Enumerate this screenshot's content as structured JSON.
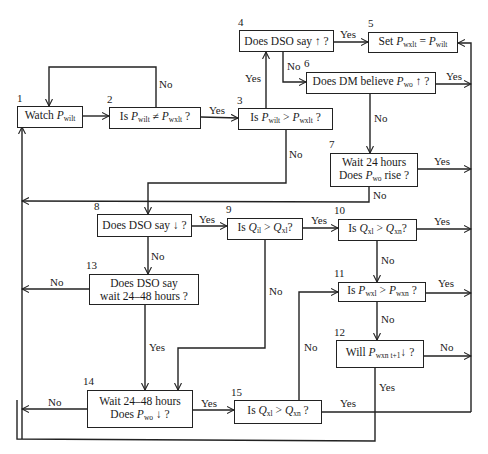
{
  "diagram": {
    "type": "flowchart",
    "nodes": [
      {
        "id": "1",
        "parts": [
          {
            "t": "Watch "
          },
          {
            "v": "P",
            "s": "wilt"
          }
        ]
      },
      {
        "id": "2",
        "parts": [
          {
            "t": "Is "
          },
          {
            "v": "P",
            "s": "wilt"
          },
          {
            "t": " ≠ "
          },
          {
            "v": "P",
            "s": "wxlt"
          },
          {
            "t": " ?"
          }
        ]
      },
      {
        "id": "3",
        "parts": [
          {
            "t": "Is "
          },
          {
            "v": "P",
            "s": "wilt"
          },
          {
            "t": " > "
          },
          {
            "v": "P",
            "s": "wxlt"
          },
          {
            "t": " ?"
          }
        ]
      },
      {
        "id": "4",
        "parts": [
          {
            "t": "Does DSO say ↑ ?"
          }
        ]
      },
      {
        "id": "5",
        "parts": [
          {
            "t": "Set "
          },
          {
            "v": "P",
            "s": "wxlt"
          },
          {
            "t": " = "
          },
          {
            "v": "P",
            "s": "wilt"
          }
        ]
      },
      {
        "id": "6",
        "parts": [
          {
            "t": "Does DM believe "
          },
          {
            "v": "P",
            "s": "wo"
          },
          {
            "t": " ↑ ?"
          }
        ]
      },
      {
        "id": "7",
        "lines": [
          [
            {
              "t": "Wait 24 hours"
            }
          ],
          [
            {
              "t": "Does "
            },
            {
              "v": "P",
              "s": "wo"
            },
            {
              "t": " rise ?"
            }
          ]
        ]
      },
      {
        "id": "8",
        "parts": [
          {
            "t": "Does DSO say ↓ ?"
          }
        ]
      },
      {
        "id": "9",
        "parts": [
          {
            "t": "Is "
          },
          {
            "v": "Q",
            "s": "il"
          },
          {
            "t": " > "
          },
          {
            "v": "Q",
            "s": "xl"
          },
          {
            "t": "?"
          }
        ]
      },
      {
        "id": "10",
        "parts": [
          {
            "t": "Is "
          },
          {
            "v": "Q",
            "s": "xl"
          },
          {
            "t": " > "
          },
          {
            "v": "Q",
            "s": "xn"
          },
          {
            "t": "?"
          }
        ]
      },
      {
        "id": "11",
        "parts": [
          {
            "t": "Is "
          },
          {
            "v": "P",
            "s": "wxl"
          },
          {
            "t": " > "
          },
          {
            "v": "P",
            "s": "wxn"
          },
          {
            "t": " ?"
          }
        ]
      },
      {
        "id": "12",
        "parts": [
          {
            "t": "Will "
          },
          {
            "v": "P",
            "s": "wxn t+1"
          },
          {
            "t": "↓ ?"
          }
        ]
      },
      {
        "id": "13",
        "lines": [
          [
            {
              "t": "Does DSO say"
            }
          ],
          [
            {
              "t": "wait 24–48 hours ?"
            }
          ]
        ]
      },
      {
        "id": "14",
        "lines": [
          [
            {
              "t": "Wait 24–48 hours"
            }
          ],
          [
            {
              "t": "Does "
            },
            {
              "v": "P",
              "s": "wo"
            },
            {
              "t": " ↓ ?"
            }
          ]
        ]
      },
      {
        "id": "15",
        "parts": [
          {
            "t": "Is "
          },
          {
            "v": "Q",
            "s": "xl"
          },
          {
            "t": " > "
          },
          {
            "v": "Q",
            "s": "xn"
          },
          {
            "t": " ?"
          }
        ]
      }
    ],
    "edges": [
      {
        "from": "1",
        "to": "2",
        "label": ""
      },
      {
        "from": "2",
        "to": "3",
        "label": "Yes"
      },
      {
        "from": "2",
        "to": "1",
        "label": "No"
      },
      {
        "from": "3",
        "to": "4",
        "label": "Yes"
      },
      {
        "from": "3",
        "to": "8",
        "label": "No"
      },
      {
        "from": "4",
        "to": "5",
        "label": "Yes"
      },
      {
        "from": "4",
        "to": "6",
        "label": "No"
      },
      {
        "from": "6",
        "to": "5",
        "label": "Yes"
      },
      {
        "from": "6",
        "to": "7",
        "label": "No"
      },
      {
        "from": "7",
        "to": "5",
        "label": "Yes"
      },
      {
        "from": "7",
        "to": "1",
        "label": "No"
      },
      {
        "from": "8",
        "to": "9",
        "label": "Yes"
      },
      {
        "from": "8",
        "to": "13",
        "label": "No"
      },
      {
        "from": "9",
        "to": "10",
        "label": "Yes"
      },
      {
        "from": "9",
        "to": "14",
        "label": "No"
      },
      {
        "from": "10",
        "to": "5",
        "label": "Yes"
      },
      {
        "from": "10",
        "to": "11",
        "label": "No"
      },
      {
        "from": "11",
        "to": "5",
        "label": "Yes"
      },
      {
        "from": "11",
        "to": "12",
        "label": "No"
      },
      {
        "from": "12",
        "to": "5",
        "label": "No"
      },
      {
        "from": "12",
        "to": "1",
        "label": "Yes"
      },
      {
        "from": "13",
        "to": "1",
        "label": "No"
      },
      {
        "from": "13",
        "to": "14",
        "label": "Yes"
      },
      {
        "from": "14",
        "to": "1",
        "label": "No"
      },
      {
        "from": "14",
        "to": "15",
        "label": "Yes"
      },
      {
        "from": "15",
        "to": "11",
        "label": "No"
      },
      {
        "from": "15",
        "to": "5",
        "label": "Yes"
      }
    ]
  }
}
